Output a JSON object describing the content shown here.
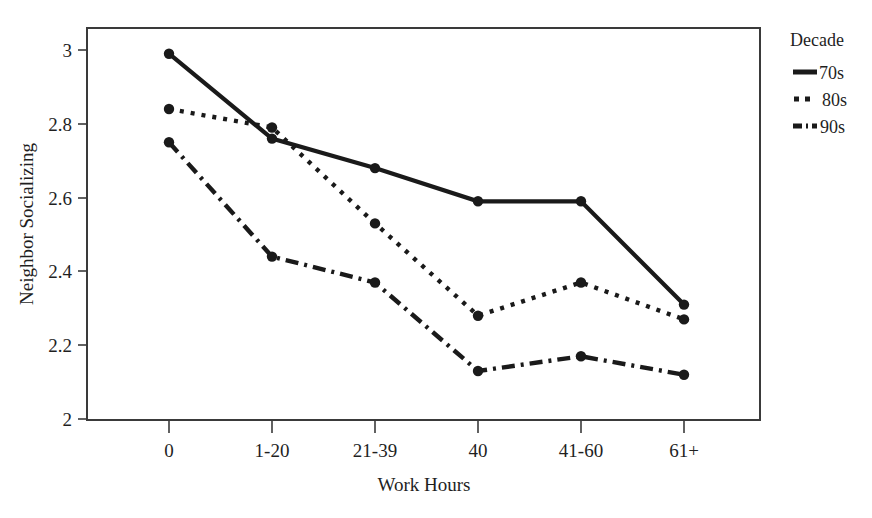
{
  "chart_data": {
    "type": "line",
    "title": "",
    "xlabel": "Work Hours",
    "ylabel": "Neighbor Socializing",
    "categories": [
      "0",
      "1-20",
      "21-39",
      "40",
      "41-60",
      "61+"
    ],
    "ytick_labels": [
      "2",
      "2.2",
      "2.4",
      "2.6",
      "2.8",
      "3"
    ],
    "ytick_values": [
      2,
      2.2,
      2.4,
      2.6,
      2.8,
      3
    ],
    "ylim": [
      2,
      3.05
    ],
    "grid": false,
    "legend_position": "right",
    "series": [
      {
        "name": "70s",
        "style": "solid",
        "values": [
          2.99,
          2.76,
          2.68,
          2.59,
          2.59,
          2.31
        ]
      },
      {
        "name": "80s",
        "style": "dotted",
        "values": [
          2.84,
          2.79,
          2.53,
          2.28,
          2.37,
          2.27
        ]
      },
      {
        "name": "90s",
        "style": "dash-dot",
        "values": [
          2.75,
          2.44,
          2.37,
          2.13,
          2.17,
          2.12
        ]
      }
    ]
  },
  "legend": {
    "title": "Decade",
    "entries": [
      {
        "label": "70s",
        "style": "solid"
      },
      {
        "label": "80s",
        "style": "dotted"
      },
      {
        "label": "90s",
        "style": "dash-dot"
      }
    ]
  },
  "axes": {
    "x_title": "Work Hours",
    "y_title": "Neighbor Socializing",
    "x_tick_labels": [
      "0",
      "1-20",
      "21-39",
      "40",
      "41-60",
      "61+"
    ],
    "y_tick_labels": [
      "2",
      "2.2",
      "2.4",
      "2.6",
      "2.8",
      "3"
    ]
  },
  "colors": {
    "line": "#1a1a1a",
    "frame": "#3a3a3a",
    "background": "#ffffff",
    "text": "#1f1f1f"
  }
}
